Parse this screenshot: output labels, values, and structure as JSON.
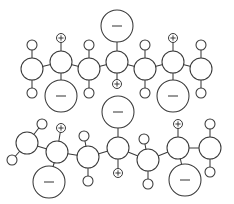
{
  "figure": {
    "width": 234,
    "height": 204,
    "background_color": "#ffffff",
    "line_color": "#3a3a3a",
    "charge_symbols": {
      "positive": "+",
      "negative": "-"
    }
  },
  "chart_data": {
    "type": "diagram",
    "subtitle": "",
    "xlabel": "",
    "ylabel": "",
    "legend": [],
    "annotations": [],
    "node_kinds": [
      {
        "kind": "backbone",
        "radius": 11,
        "label": ""
      },
      {
        "kind": "terminal",
        "radius": 11,
        "label": ""
      },
      {
        "kind": "substituent",
        "radius": 5,
        "label": ""
      },
      {
        "kind": "charge-positive",
        "radius": 4.5,
        "label": "+"
      },
      {
        "kind": "charge-negative",
        "radius": 16,
        "label": "-"
      }
    ],
    "chains": [
      {
        "name": "upper-chain",
        "nodes": [
          {
            "id": "u1",
            "kind": "terminal",
            "x": 32,
            "y": 69,
            "r": 11
          },
          {
            "id": "u2",
            "kind": "backbone",
            "x": 61,
            "y": 62,
            "r": 11
          },
          {
            "id": "u3",
            "kind": "backbone",
            "x": 89,
            "y": 69,
            "r": 11
          },
          {
            "id": "u4",
            "kind": "backbone",
            "x": 117,
            "y": 62,
            "r": 11
          },
          {
            "id": "u5",
            "kind": "backbone",
            "x": 145,
            "y": 69,
            "r": 11
          },
          {
            "id": "u6",
            "kind": "backbone",
            "x": 173,
            "y": 62,
            "r": 11
          },
          {
            "id": "u7",
            "kind": "terminal",
            "x": 201,
            "y": 69,
            "r": 11
          },
          {
            "id": "us1",
            "kind": "substituent",
            "x": 32,
            "y": 45,
            "r": 5
          },
          {
            "id": "us2",
            "kind": "substituent",
            "x": 32,
            "y": 93,
            "r": 5
          },
          {
            "id": "us3",
            "kind": "substituent",
            "x": 89,
            "y": 45,
            "r": 5
          },
          {
            "id": "us4",
            "kind": "substituent",
            "x": 89,
            "y": 93,
            "r": 5
          },
          {
            "id": "us5",
            "kind": "substituent",
            "x": 145,
            "y": 45,
            "r": 5
          },
          {
            "id": "us6",
            "kind": "substituent",
            "x": 145,
            "y": 93,
            "r": 5
          },
          {
            "id": "us7",
            "kind": "substituent",
            "x": 201,
            "y": 45,
            "r": 5
          },
          {
            "id": "us8",
            "kind": "substituent",
            "x": 201,
            "y": 93,
            "r": 5
          },
          {
            "id": "up1",
            "kind": "charge-positive",
            "x": 61,
            "y": 38,
            "r": 4.5,
            "label": "+"
          },
          {
            "id": "up2",
            "kind": "charge-positive",
            "x": 117,
            "y": 84,
            "r": 4.5,
            "label": "+"
          },
          {
            "id": "up3",
            "kind": "charge-positive",
            "x": 173,
            "y": 38,
            "r": 4.5,
            "label": "+"
          },
          {
            "id": "un1",
            "kind": "charge-negative",
            "x": 61,
            "y": 96,
            "r": 16,
            "label": "-"
          },
          {
            "id": "un2",
            "kind": "charge-negative",
            "x": 117,
            "y": 26,
            "r": 16,
            "label": "-"
          },
          {
            "id": "un3",
            "kind": "charge-negative",
            "x": 173,
            "y": 96,
            "r": 16,
            "label": "-"
          }
        ],
        "bonds": [
          [
            "u1",
            "u2"
          ],
          [
            "u2",
            "u3"
          ],
          [
            "u3",
            "u4"
          ],
          [
            "u4",
            "u5"
          ],
          [
            "u5",
            "u6"
          ],
          [
            "u6",
            "u7"
          ],
          [
            "u1",
            "us1"
          ],
          [
            "u1",
            "us2"
          ],
          [
            "u3",
            "us3"
          ],
          [
            "u3",
            "us4"
          ],
          [
            "u5",
            "us5"
          ],
          [
            "u5",
            "us6"
          ],
          [
            "u7",
            "us7"
          ],
          [
            "u7",
            "us8"
          ],
          [
            "u2",
            "up1"
          ],
          [
            "u2",
            "un1"
          ],
          [
            "u4",
            "un2"
          ],
          [
            "u4",
            "up2"
          ],
          [
            "u6",
            "up3"
          ],
          [
            "u6",
            "un3"
          ]
        ]
      },
      {
        "name": "lower-chain",
        "nodes": [
          {
            "id": "l1",
            "kind": "terminal",
            "x": 27,
            "y": 143,
            "r": 11
          },
          {
            "id": "l2",
            "kind": "backbone",
            "x": 57,
            "y": 152,
            "r": 11
          },
          {
            "id": "l3",
            "kind": "backbone",
            "x": 88,
            "y": 157,
            "r": 11
          },
          {
            "id": "l4",
            "kind": "backbone",
            "x": 118,
            "y": 148,
            "r": 11
          },
          {
            "id": "l5",
            "kind": "backbone",
            "x": 148,
            "y": 160,
            "r": 11
          },
          {
            "id": "l6",
            "kind": "backbone",
            "x": 178,
            "y": 148,
            "r": 11
          },
          {
            "id": "l7",
            "kind": "terminal",
            "x": 210,
            "y": 148,
            "r": 11
          },
          {
            "id": "ls1",
            "kind": "substituent",
            "x": 42,
            "y": 124,
            "r": 5
          },
          {
            "id": "ls2",
            "kind": "substituent",
            "x": 12,
            "y": 160,
            "r": 5
          },
          {
            "id": "ls3",
            "kind": "substituent",
            "x": 84,
            "y": 136,
            "r": 5
          },
          {
            "id": "ls4",
            "kind": "substituent",
            "x": 88,
            "y": 181,
            "r": 5
          },
          {
            "id": "ls5",
            "kind": "substituent",
            "x": 144,
            "y": 139,
            "r": 5
          },
          {
            "id": "ls6",
            "kind": "substituent",
            "x": 148,
            "y": 184,
            "r": 5
          },
          {
            "id": "ls7",
            "kind": "substituent",
            "x": 210,
            "y": 124,
            "r": 5
          },
          {
            "id": "ls8",
            "kind": "substituent",
            "x": 210,
            "y": 172,
            "r": 5
          },
          {
            "id": "lp1",
            "kind": "charge-positive",
            "x": 61,
            "y": 128,
            "r": 4.5,
            "label": "+"
          },
          {
            "id": "lp2",
            "kind": "charge-positive",
            "x": 118,
            "y": 173,
            "r": 4.5,
            "label": "+"
          },
          {
            "id": "lp3",
            "kind": "charge-positive",
            "x": 178,
            "y": 124,
            "r": 4.5,
            "label": "+"
          },
          {
            "id": "ln1",
            "kind": "charge-negative",
            "x": 49,
            "y": 182,
            "r": 16,
            "label": "-"
          },
          {
            "id": "ln2",
            "kind": "charge-negative",
            "x": 118,
            "y": 112,
            "r": 16,
            "label": "-"
          },
          {
            "id": "ln3",
            "kind": "charge-negative",
            "x": 185,
            "y": 180,
            "r": 16,
            "label": "-"
          }
        ],
        "bonds": [
          [
            "l1",
            "l2"
          ],
          [
            "l2",
            "l3"
          ],
          [
            "l3",
            "l4"
          ],
          [
            "l4",
            "l5"
          ],
          [
            "l5",
            "l6"
          ],
          [
            "l6",
            "l7"
          ],
          [
            "l1",
            "ls1"
          ],
          [
            "l1",
            "ls2"
          ],
          [
            "l3",
            "ls3"
          ],
          [
            "l3",
            "ls4"
          ],
          [
            "l5",
            "ls5"
          ],
          [
            "l5",
            "ls6"
          ],
          [
            "l7",
            "ls7"
          ],
          [
            "l7",
            "ls8"
          ],
          [
            "l2",
            "lp1"
          ],
          [
            "l2",
            "ln1"
          ],
          [
            "l4",
            "ln2"
          ],
          [
            "l4",
            "lp2"
          ],
          [
            "l6",
            "lp3"
          ],
          [
            "l6",
            "ln3"
          ]
        ]
      }
    ]
  }
}
